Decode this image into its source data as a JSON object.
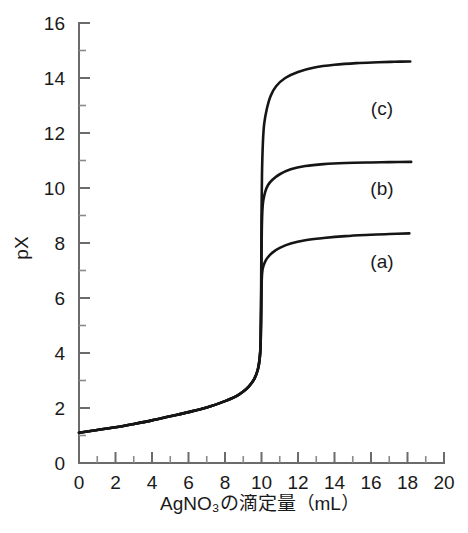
{
  "chart_data": {
    "type": "line",
    "title": "",
    "subtitle": "",
    "xlabel": "AgNO₃の滴定量（mL）",
    "ylabel": "pX",
    "xlim": [
      0,
      20
    ],
    "ylim": [
      0,
      16
    ],
    "x_major_ticks": [
      0,
      2,
      4,
      6,
      8,
      10,
      12,
      14,
      16,
      18,
      20
    ],
    "x_minor_ticks": [
      1,
      3,
      5,
      7,
      9,
      11,
      13,
      15,
      17,
      19
    ],
    "y_major_ticks": [
      0,
      2,
      4,
      6,
      8,
      10,
      12,
      14,
      16
    ],
    "y_minor_ticks": [
      1,
      3,
      5,
      7,
      9,
      11,
      13,
      15
    ],
    "x_tick_labels": [
      "0",
      "2",
      "4",
      "6",
      "8",
      "10",
      "12",
      "14",
      "16",
      "18",
      "20"
    ],
    "y_tick_labels": [
      "0",
      "2",
      "4",
      "6",
      "8",
      "10",
      "12",
      "14",
      "16"
    ],
    "grid": false,
    "legend_position": "inline-right",
    "equivalence_point_x": 10.0,
    "axis_color": "#6b6b6b",
    "curve_color": "#151515",
    "series": [
      {
        "name": "(a)",
        "label": "(a)",
        "label_x": 16.6,
        "label_y": 7.35,
        "plateau": 8.35,
        "post_break_px": 7.0,
        "x": [
          0.0,
          1.0,
          2.0,
          3.0,
          4.0,
          5.0,
          6.0,
          7.0,
          8.0,
          8.6,
          9.0,
          9.3,
          9.6,
          9.8,
          9.9,
          9.95,
          9.98,
          10.0,
          10.02,
          10.05,
          10.1,
          10.2,
          10.35,
          10.6,
          11.0,
          11.6,
          12.4,
          13.4,
          14.6,
          16.0,
          17.0,
          18.1
        ],
        "y": [
          1.1,
          1.2,
          1.3,
          1.42,
          1.55,
          1.7,
          1.85,
          2.02,
          2.25,
          2.42,
          2.6,
          2.78,
          3.05,
          3.4,
          3.8,
          4.3,
          5.2,
          6.3,
          6.75,
          7.0,
          7.15,
          7.32,
          7.48,
          7.65,
          7.82,
          7.98,
          8.1,
          8.18,
          8.25,
          8.3,
          8.33,
          8.35
        ]
      },
      {
        "name": "(b)",
        "label": "(b)",
        "label_x": 16.6,
        "label_y": 10.0,
        "plateau": 10.95,
        "post_break_px": 9.75,
        "x": [
          0.0,
          1.0,
          2.0,
          3.0,
          4.0,
          5.0,
          6.0,
          7.0,
          8.0,
          8.6,
          9.0,
          9.3,
          9.6,
          9.8,
          9.9,
          9.95,
          9.98,
          10.0,
          10.02,
          10.05,
          10.1,
          10.2,
          10.35,
          10.6,
          11.0,
          11.6,
          12.4,
          13.4,
          14.6,
          16.0,
          17.0,
          18.2
        ],
        "y": [
          1.1,
          1.2,
          1.3,
          1.42,
          1.55,
          1.7,
          1.85,
          2.02,
          2.25,
          2.42,
          2.6,
          2.78,
          3.05,
          3.4,
          3.8,
          4.3,
          5.6,
          7.6,
          8.6,
          9.2,
          9.55,
          9.85,
          10.1,
          10.3,
          10.5,
          10.68,
          10.8,
          10.87,
          10.91,
          10.93,
          10.94,
          10.95
        ]
      },
      {
        "name": "(c)",
        "label": "(c)",
        "label_x": 16.6,
        "label_y": 12.9,
        "plateau": 14.6,
        "post_break_px": 13.2,
        "x": [
          0.0,
          1.0,
          2.0,
          3.0,
          4.0,
          5.0,
          6.0,
          7.0,
          8.0,
          8.6,
          9.0,
          9.3,
          9.6,
          9.8,
          9.9,
          9.95,
          9.98,
          10.0,
          10.03,
          10.08,
          10.15,
          10.3,
          10.5,
          10.8,
          11.3,
          12.0,
          12.9,
          14.0,
          15.2,
          16.4,
          17.3,
          18.15
        ],
        "y": [
          1.1,
          1.2,
          1.3,
          1.42,
          1.55,
          1.7,
          1.85,
          2.02,
          2.25,
          2.42,
          2.6,
          2.78,
          3.05,
          3.4,
          3.8,
          4.4,
          6.2,
          9.0,
          10.6,
          11.7,
          12.35,
          12.9,
          13.35,
          13.7,
          14.0,
          14.22,
          14.38,
          14.48,
          14.54,
          14.57,
          14.59,
          14.6
        ]
      }
    ]
  }
}
